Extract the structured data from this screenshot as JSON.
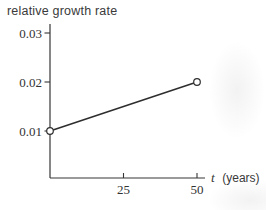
{
  "chart_data": {
    "type": "line",
    "title": "relative growth rate",
    "xlabel_variable": "t",
    "xlabel_unit": "(years)",
    "ylabel": "relative growth rate",
    "x_ticks": [
      25,
      50
    ],
    "y_ticks": [
      "0.01",
      "0.02",
      "0.03"
    ],
    "points": [
      {
        "x": 0,
        "y": 0.01
      },
      {
        "x": 50,
        "y": 0.02
      }
    ],
    "series": [
      {
        "name": "relative growth rate",
        "x": [
          0,
          50
        ],
        "values": [
          0.01,
          0.02
        ]
      }
    ],
    "marker": "open-circle",
    "grid": false,
    "legend": "none",
    "xlim": [
      0,
      53
    ],
    "ylim": [
      0,
      0.031
    ],
    "line_color": "#2e2e2e",
    "text_color": "#3a3a3a",
    "background_color": "#ffffff"
  }
}
